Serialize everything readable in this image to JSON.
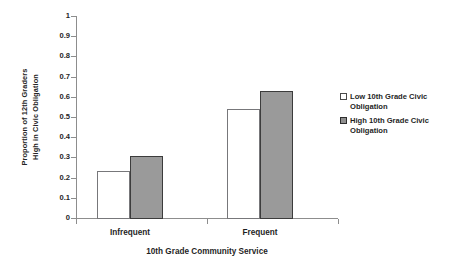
{
  "chart_data": {
    "type": "bar",
    "title": "",
    "xlabel": "10th Grade Community Service",
    "ylabel": "Proportion of 12th Graders High in Civic Obligation",
    "ylabel_lines": [
      "Proportion of 12th Graders",
      "High in Civic Obligation"
    ],
    "categories": [
      "Infrequent",
      "Frequent"
    ],
    "series": [
      {
        "name": "Low 10th Grade Civic Obligation",
        "values": [
          0.235,
          0.54
        ],
        "fill": "#ffffff",
        "stroke": "#77777a"
      },
      {
        "name": "High 10th Grade Civic Obligation",
        "values": [
          0.305,
          0.63
        ],
        "fill": "#9a9a9a",
        "stroke": "#3c3c3c"
      }
    ],
    "ylim": [
      0,
      1
    ],
    "ytick_values": [
      1,
      0.9,
      0.8,
      0.7,
      0.6,
      0.5,
      0.4,
      0.3,
      0.2,
      0.1,
      0
    ],
    "ytick_labels": [
      "1",
      "0.9",
      "0.8",
      "0.7",
      "0.6",
      "0.5",
      "0.4",
      "0.3",
      "0.2",
      "0.1",
      "0"
    ],
    "grid": false,
    "legend_position": "right"
  },
  "legend": {
    "entries": [
      {
        "label": "Low 10th Grade Civic Obligation",
        "swatch": "low-swatch"
      },
      {
        "label": "High 10th Grade Civic Obligation",
        "swatch": "high-swatch"
      }
    ]
  },
  "axis": {
    "x_title": "10th Grade Community Service",
    "y_title_line1": "Proportion of 12th Graders",
    "y_title_line2": "High in Civic Obligation",
    "category_labels": [
      "Infrequent",
      "Frequent"
    ]
  },
  "colors": {
    "low_fill": "#ffffff",
    "high_fill": "#9a9a9a",
    "axis": "#8d8d8d",
    "text": "#1f1f1f"
  }
}
